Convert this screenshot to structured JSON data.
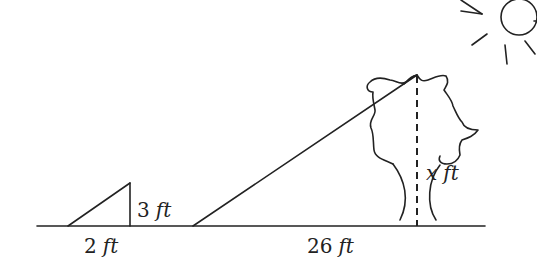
{
  "diagram": {
    "type": "similar-triangles-shadow-problem",
    "small_triangle": {
      "height_label": {
        "value": "3",
        "unit": "ft"
      },
      "base_label": {
        "value": "2",
        "unit": "ft"
      }
    },
    "large_triangle": {
      "base_label": {
        "value": "26",
        "unit": "ft"
      },
      "height_label": {
        "value": "x",
        "unit": "ft"
      }
    },
    "objects": [
      "sun",
      "tree",
      "ground-line",
      "dashed-height-line"
    ]
  }
}
